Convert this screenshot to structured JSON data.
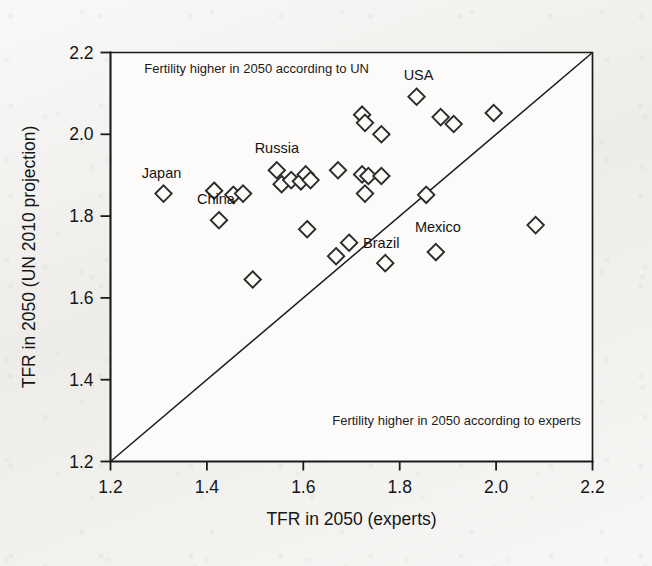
{
  "figure": {
    "background_color": "#f2f1ee",
    "plot_background_color": "#fcfbf9",
    "ink_color": "#1b1b1b"
  },
  "chart_data": {
    "type": "scatter",
    "title": "",
    "xlabel": "TFR in 2050 (experts)",
    "ylabel": "TFR in 2050 (UN 2010 projection)",
    "xlim": [
      1.2,
      2.2
    ],
    "ylim": [
      1.2,
      2.2
    ],
    "xticks": [
      "1.2",
      "1.4",
      "1.6",
      "1.8",
      "2.0",
      "2.2"
    ],
    "yticks": [
      "1.2",
      "1.4",
      "1.6",
      "1.8",
      "2.0",
      "2.2"
    ],
    "xtick_values": [
      1.2,
      1.4,
      1.6,
      1.8,
      2.0,
      2.2
    ],
    "ytick_values": [
      1.2,
      1.4,
      1.6,
      1.8,
      2.0,
      2.2
    ],
    "grid": false,
    "legend": "none",
    "marker": "diamond-open",
    "reference_line": {
      "name": "identity-line",
      "from": [
        1.2,
        1.2
      ],
      "to": [
        2.2,
        2.2
      ],
      "description": "y = x diagonal"
    },
    "annotations": [
      {
        "name": "upper-region-note",
        "text": "Fertility higher in 2050 according to UN",
        "x": 1.27,
        "y": 2.15,
        "anchor": "start"
      },
      {
        "name": "lower-region-note",
        "text": "Fertility higher in 2050 according to experts",
        "x": 1.66,
        "y": 1.29,
        "anchor": "start"
      }
    ],
    "points": [
      {
        "label": "Japan",
        "x": 1.31,
        "y": 1.855,
        "label_dx": -2,
        "label_dy": -16,
        "label_anchor": "middle"
      },
      {
        "label": "China",
        "x": 1.425,
        "y": 1.79,
        "label_dx": -3,
        "label_dy": -16,
        "label_anchor": "middle"
      },
      {
        "label": "Russia",
        "x": 1.545,
        "y": 1.912,
        "label_dx": 0,
        "label_dy": -17,
        "label_anchor": "middle"
      },
      {
        "label": "USA",
        "x": 1.835,
        "y": 2.092,
        "label_dx": 2,
        "label_dy": -17,
        "label_anchor": "middle"
      },
      {
        "label": "Brazil",
        "x": 1.77,
        "y": 1.685,
        "label_dx": -4,
        "label_dy": -15,
        "label_anchor": "middle"
      },
      {
        "label": "Mexico",
        "x": 1.875,
        "y": 1.712,
        "label_dx": 2,
        "label_dy": -20,
        "label_anchor": "middle"
      },
      {
        "label": "",
        "x": 1.415,
        "y": 1.862
      },
      {
        "label": "",
        "x": 1.455,
        "y": 1.852
      },
      {
        "label": "",
        "x": 1.475,
        "y": 1.855
      },
      {
        "label": "",
        "x": 1.495,
        "y": 1.645
      },
      {
        "label": "",
        "x": 1.555,
        "y": 1.878
      },
      {
        "label": "",
        "x": 1.575,
        "y": 1.888
      },
      {
        "label": "",
        "x": 1.595,
        "y": 1.885
      },
      {
        "label": "",
        "x": 1.605,
        "y": 1.902
      },
      {
        "label": "",
        "x": 1.615,
        "y": 1.888
      },
      {
        "label": "",
        "x": 1.608,
        "y": 1.768
      },
      {
        "label": "",
        "x": 1.668,
        "y": 1.702
      },
      {
        "label": "",
        "x": 1.672,
        "y": 1.912
      },
      {
        "label": "",
        "x": 1.695,
        "y": 1.735
      },
      {
        "label": "",
        "x": 1.722,
        "y": 2.048
      },
      {
        "label": "",
        "x": 1.728,
        "y": 2.028
      },
      {
        "label": "",
        "x": 1.722,
        "y": 1.902
      },
      {
        "label": "",
        "x": 1.735,
        "y": 1.898
      },
      {
        "label": "",
        "x": 1.728,
        "y": 1.855
      },
      {
        "label": "",
        "x": 1.762,
        "y": 1.898
      },
      {
        "label": "",
        "x": 1.762,
        "y": 2.0
      },
      {
        "label": "",
        "x": 1.885,
        "y": 2.042
      },
      {
        "label": "",
        "x": 1.912,
        "y": 2.025
      },
      {
        "label": "",
        "x": 1.855,
        "y": 1.852
      },
      {
        "label": "",
        "x": 1.995,
        "y": 2.052
      },
      {
        "label": "",
        "x": 2.082,
        "y": 1.778
      }
    ]
  }
}
